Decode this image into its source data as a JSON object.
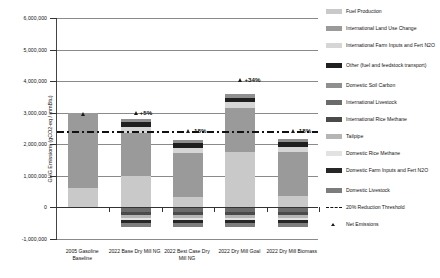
{
  "chart_data": {
    "type": "bar",
    "subtype": "stacked-bar-with-markers",
    "title": "",
    "xlabel": "",
    "ylabel": "GHG Emissions (gCO2-eq / mmBtu)",
    "ylim": [
      -1000000,
      6000000
    ],
    "ytick_labels": [
      "6,000,000",
      "5,000,000",
      "4,000,000",
      "3,000,000",
      "2,000,000",
      "1,000,000",
      "0",
      "-1,000,000"
    ],
    "ytick_values": [
      6000000,
      5000000,
      4000000,
      3000000,
      2000000,
      1000000,
      0,
      -1000000
    ],
    "grid": true,
    "legend_position": "right",
    "categories": [
      "2005 Gasoline Baseline",
      "2022 Base Dry Mill NG",
      "2022 Best Case Dry Mill NG",
      "2022 Dry Mill Goal",
      "2022 Dry Mill Biomass"
    ],
    "series": [
      {
        "name": "Fuel Production",
        "color": "#c9c9c9",
        "values": [
          610000,
          990000,
          330000,
          1770000,
          360000
        ]
      },
      {
        "name": "International Land Use Change",
        "color": "#9a9a9a",
        "values": [
          2380000,
          1380000,
          1380000,
          1380000,
          1380000
        ]
      },
      {
        "name": "International Farm Inputs and Fert N2O",
        "color": "#d6d6d6",
        "values": [
          0,
          180000,
          180000,
          180000,
          180000
        ]
      },
      {
        "name": "Other (fuel and feedstock transport)",
        "color": "#1f1f1f",
        "values": [
          0,
          150000,
          150000,
          150000,
          150000
        ]
      },
      {
        "name": "Domestic Soil Carbon",
        "color": "#8f8f8f",
        "values": [
          0,
          110000,
          110000,
          110000,
          110000
        ]
      },
      {
        "name": "International Livestock",
        "color": "#6b6b6b",
        "values": [
          0,
          -130000,
          -130000,
          -130000,
          -130000
        ]
      },
      {
        "name": "International Rice Methane",
        "color": "#4a4a4a",
        "values": [
          0,
          -110000,
          -110000,
          -110000,
          -110000
        ]
      },
      {
        "name": "Tailpipe",
        "color": "#b5b5b5",
        "values": [
          0,
          -90000,
          -90000,
          -90000,
          -90000
        ]
      },
      {
        "name": "Domestic Rice Methane",
        "color": "#e2e2e2",
        "values": [
          0,
          -70000,
          -70000,
          -70000,
          -70000
        ]
      },
      {
        "name": "Domestic Farm Inputs and Fert N2O",
        "color": "#262626",
        "values": [
          0,
          -100000,
          -100000,
          -100000,
          -100000
        ]
      },
      {
        "name": "Domestic Livestock",
        "color": "#7d7d7d",
        "values": [
          0,
          -120000,
          -120000,
          -120000,
          -120000
        ]
      }
    ],
    "threshold": {
      "label": "20% Reduction Threshold",
      "value": 2400000
    },
    "net_emissions": {
      "label": "Net Emissions",
      "values": [
        2960000,
        2980000,
        2420000,
        4040000,
        2420000
      ],
      "pct_labels": [
        "",
        "+5%",
        "-18%",
        "+34%",
        "-18%"
      ]
    }
  },
  "legend": {
    "items": [
      {
        "label": "Fuel Production",
        "type": "swatch"
      },
      {
        "label": "International Land Use Change",
        "type": "swatch"
      },
      {
        "label": "International Farm Inputs and Fert N2O",
        "type": "swatch"
      },
      {
        "label": "Other (fuel and feedstock transport)",
        "type": "swatch"
      },
      {
        "label": "Domestic Soil Carbon",
        "type": "swatch"
      },
      {
        "label": "International Livestock",
        "type": "swatch"
      },
      {
        "label": "International Rice Methane",
        "type": "swatch"
      },
      {
        "label": "Tailpipe",
        "type": "swatch"
      },
      {
        "label": "Domestic Rice Methane",
        "type": "swatch"
      },
      {
        "label": "Domestic Farm Inputs and Fert N2O",
        "type": "swatch"
      },
      {
        "label": "Domestic Livestock",
        "type": "swatch"
      },
      {
        "label": "20% Reduction Threshold",
        "type": "line"
      },
      {
        "label": "Net Emissions",
        "type": "triangle"
      }
    ]
  }
}
